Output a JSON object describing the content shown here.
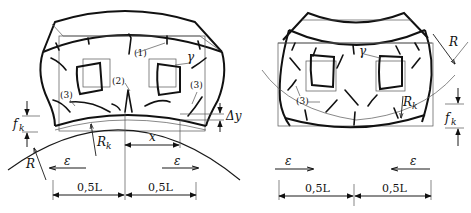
{
  "figure": {
    "left_panel": {
      "description": "Element bent convex (hogging) over support of radius R with cracks",
      "labels": {
        "crack_1": "(1)",
        "crack_2": "(2)",
        "crack_3_left": "(3)",
        "crack_3_right": "(3)",
        "gamma": "γ",
        "f_k": "f",
        "f_k_sub": "k",
        "R": "R",
        "R_k": "R",
        "R_k_sub": "k",
        "x": "x",
        "delta_y": "Δy",
        "eps_left": "ε",
        "eps_right": "ε",
        "dim_left": "0,5L",
        "dim_right": "0,5L"
      }
    },
    "right_panel": {
      "description": "Element bent concave (sagging) with cracks",
      "labels": {
        "gamma": "γ",
        "crack_3": "(3)",
        "R": "R",
        "R_k": "R",
        "R_k_sub": "k",
        "f_k": "f",
        "f_k_sub": "k",
        "eps_left": "ε",
        "eps_right": "ε",
        "dim_left": "0,5L",
        "dim_right": "0,5L"
      }
    }
  }
}
